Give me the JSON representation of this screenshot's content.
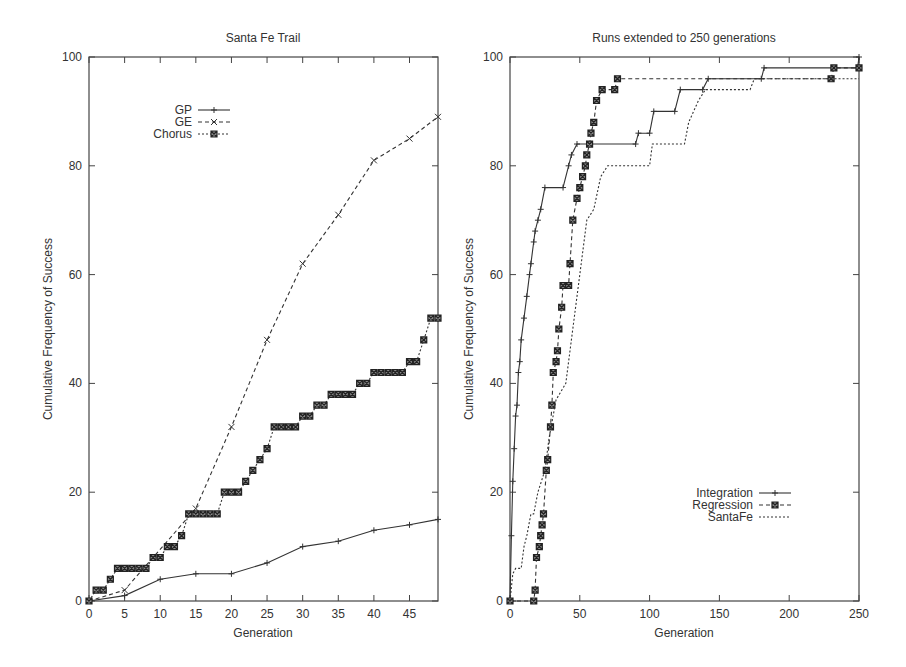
{
  "chart_data": [
    {
      "type": "line",
      "title": "Santa Fe Trail",
      "xlabel": "Generation",
      "ylabel": "Cumulative Frequency of Success",
      "xlim": [
        0,
        49
      ],
      "ylim": [
        0,
        100
      ],
      "xticks": [
        0,
        5,
        10,
        15,
        20,
        25,
        30,
        35,
        40,
        45
      ],
      "yticks": [
        0,
        20,
        40,
        60,
        80,
        100
      ],
      "legend_position": "top-left",
      "grid": false,
      "series": [
        {
          "name": "GP",
          "style": "solid",
          "marker": "plus",
          "points": [
            [
              0,
              0
            ],
            [
              5,
              1
            ],
            [
              10,
              4
            ],
            [
              15,
              5
            ],
            [
              20,
              5
            ],
            [
              25,
              7
            ],
            [
              30,
              10
            ],
            [
              35,
              11
            ],
            [
              40,
              13
            ],
            [
              45,
              14
            ],
            [
              49,
              15
            ]
          ]
        },
        {
          "name": "GE",
          "style": "dashed",
          "marker": "x",
          "points": [
            [
              0,
              0
            ],
            [
              5,
              2
            ],
            [
              15,
              17
            ],
            [
              20,
              32
            ],
            [
              25,
              48
            ],
            [
              30,
              62
            ],
            [
              35,
              71
            ],
            [
              40,
              81
            ],
            [
              45,
              85
            ],
            [
              49,
              89
            ]
          ]
        },
        {
          "name": "Chorus",
          "style": "dotted",
          "marker": "boxed-x",
          "points": [
            [
              0,
              0
            ],
            [
              1,
              2
            ],
            [
              2,
              2
            ],
            [
              3,
              4
            ],
            [
              4,
              6
            ],
            [
              5,
              6
            ],
            [
              6,
              6
            ],
            [
              7,
              6
            ],
            [
              8,
              6
            ],
            [
              9,
              8
            ],
            [
              10,
              8
            ],
            [
              11,
              10
            ],
            [
              12,
              10
            ],
            [
              13,
              12
            ],
            [
              14,
              16
            ],
            [
              15,
              16
            ],
            [
              16,
              16
            ],
            [
              17,
              16
            ],
            [
              18,
              16
            ],
            [
              19,
              20
            ],
            [
              20,
              20
            ],
            [
              21,
              20
            ],
            [
              22,
              22
            ],
            [
              23,
              24
            ],
            [
              24,
              26
            ],
            [
              25,
              28
            ],
            [
              26,
              32
            ],
            [
              27,
              32
            ],
            [
              28,
              32
            ],
            [
              29,
              32
            ],
            [
              30,
              34
            ],
            [
              31,
              34
            ],
            [
              32,
              36
            ],
            [
              33,
              36
            ],
            [
              34,
              38
            ],
            [
              35,
              38
            ],
            [
              36,
              38
            ],
            [
              37,
              38
            ],
            [
              38,
              40
            ],
            [
              39,
              40
            ],
            [
              40,
              42
            ],
            [
              41,
              42
            ],
            [
              42,
              42
            ],
            [
              43,
              42
            ],
            [
              44,
              42
            ],
            [
              45,
              44
            ],
            [
              46,
              44
            ],
            [
              47,
              48
            ],
            [
              48,
              52
            ],
            [
              49,
              52
            ]
          ]
        }
      ]
    },
    {
      "type": "line",
      "title": "Runs extended to 250 generations",
      "xlabel": "Generation",
      "ylabel": "Cumulative Frequency of Success",
      "xlim": [
        0,
        250
      ],
      "ylim": [
        0,
        100
      ],
      "xticks": [
        0,
        50,
        100,
        150,
        200,
        250
      ],
      "yticks": [
        0,
        20,
        40,
        60,
        80,
        100
      ],
      "legend_position": "bottom-right",
      "grid": false,
      "series": [
        {
          "name": "Integration",
          "style": "solid",
          "marker": "plus",
          "points": [
            [
              0,
              0
            ],
            [
              1,
              12
            ],
            [
              2,
              22
            ],
            [
              3,
              28
            ],
            [
              4,
              34
            ],
            [
              5,
              36
            ],
            [
              6,
              42
            ],
            [
              7,
              44
            ],
            [
              8,
              48
            ],
            [
              10,
              52
            ],
            [
              12,
              56
            ],
            [
              14,
              60
            ],
            [
              15,
              62
            ],
            [
              17,
              66
            ],
            [
              18,
              68
            ],
            [
              20,
              70
            ],
            [
              22,
              72
            ],
            [
              25,
              76
            ],
            [
              38,
              76
            ],
            [
              42,
              80
            ],
            [
              44,
              82
            ],
            [
              48,
              84
            ],
            [
              90,
              84
            ],
            [
              92,
              86
            ],
            [
              100,
              86
            ],
            [
              103,
              90
            ],
            [
              118,
              90
            ],
            [
              122,
              94
            ],
            [
              138,
              94
            ],
            [
              142,
              96
            ],
            [
              180,
              96
            ],
            [
              182,
              98
            ],
            [
              249,
              98
            ],
            [
              250,
              100
            ]
          ]
        },
        {
          "name": "Regression",
          "style": "dashed",
          "marker": "boxed-x",
          "points": [
            [
              0,
              0
            ],
            [
              17,
              0
            ],
            [
              18,
              2
            ],
            [
              19,
              8
            ],
            [
              21,
              10
            ],
            [
              22,
              12
            ],
            [
              23,
              14
            ],
            [
              24,
              16
            ],
            [
              26,
              24
            ],
            [
              27,
              26
            ],
            [
              29,
              32
            ],
            [
              30,
              36
            ],
            [
              31,
              42
            ],
            [
              33,
              44
            ],
            [
              34,
              46
            ],
            [
              35,
              50
            ],
            [
              37,
              54
            ],
            [
              38,
              58
            ],
            [
              42,
              58
            ],
            [
              43,
              62
            ],
            [
              45,
              70
            ],
            [
              48,
              74
            ],
            [
              50,
              76
            ],
            [
              52,
              78
            ],
            [
              54,
              80
            ],
            [
              55,
              82
            ],
            [
              57,
              84
            ],
            [
              58,
              86
            ],
            [
              60,
              88
            ],
            [
              62,
              92
            ],
            [
              66,
              94
            ],
            [
              75,
              94
            ],
            [
              77,
              96
            ],
            [
              230,
              96
            ],
            [
              232,
              98
            ],
            [
              250,
              98
            ]
          ]
        },
        {
          "name": "SantaFe",
          "style": "dotted",
          "marker": "none",
          "points": [
            [
              0,
              0
            ],
            [
              2,
              5
            ],
            [
              4,
              6
            ],
            [
              8,
              6
            ],
            [
              10,
              10
            ],
            [
              12,
              12
            ],
            [
              15,
              16
            ],
            [
              17,
              16
            ],
            [
              20,
              20
            ],
            [
              25,
              24
            ],
            [
              28,
              30
            ],
            [
              33,
              37
            ],
            [
              40,
              40
            ],
            [
              45,
              50
            ],
            [
              50,
              60
            ],
            [
              55,
              70
            ],
            [
              60,
              72
            ],
            [
              65,
              78
            ],
            [
              70,
              80
            ],
            [
              100,
              80
            ],
            [
              102,
              84
            ],
            [
              125,
              84
            ],
            [
              128,
              88
            ],
            [
              135,
              92
            ],
            [
              140,
              94
            ],
            [
              172,
              94
            ],
            [
              175,
              96
            ],
            [
              250,
              96
            ]
          ]
        }
      ]
    }
  ]
}
